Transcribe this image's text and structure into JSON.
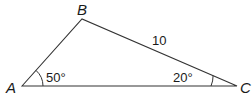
{
  "diagram": {
    "type": "triangle",
    "vertices": {
      "A": {
        "label": "A",
        "x": 22,
        "y": 86
      },
      "B": {
        "label": "B",
        "x": 82,
        "y": 19
      },
      "C": {
        "label": "C",
        "x": 237,
        "y": 86
      }
    },
    "angles": {
      "A": {
        "label": "50°"
      },
      "C": {
        "label": "20°"
      }
    },
    "sides": {
      "BC": {
        "label": "10"
      }
    },
    "colors": {
      "stroke": "#333333",
      "text": "#1a1a1a"
    }
  }
}
